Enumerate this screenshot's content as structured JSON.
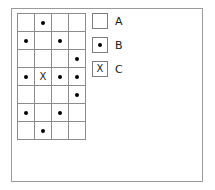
{
  "figure": {
    "type": "symbol-grid-with-legend",
    "frame_color": "#9a9a9a",
    "grid_line_color": "#8c8c8c",
    "marker_color": "#000000"
  },
  "grid": {
    "columns": 4,
    "rows": 7,
    "cells": [
      [
        {
          "symbol": "empty",
          "text": ""
        },
        {
          "symbol": "dot",
          "text": ""
        },
        {
          "symbol": "empty",
          "text": ""
        },
        {
          "symbol": "empty",
          "text": ""
        }
      ],
      [
        {
          "symbol": "dot",
          "text": ""
        },
        {
          "symbol": "empty",
          "text": ""
        },
        {
          "symbol": "dot",
          "text": ""
        },
        {
          "symbol": "empty",
          "text": ""
        }
      ],
      [
        {
          "symbol": "empty",
          "text": ""
        },
        {
          "symbol": "empty",
          "text": ""
        },
        {
          "symbol": "empty",
          "text": ""
        },
        {
          "symbol": "dot",
          "text": ""
        }
      ],
      [
        {
          "symbol": "dot",
          "text": ""
        },
        {
          "symbol": "x",
          "text": "X"
        },
        {
          "symbol": "dot",
          "text": ""
        },
        {
          "symbol": "dot",
          "text": ""
        }
      ],
      [
        {
          "symbol": "empty",
          "text": ""
        },
        {
          "symbol": "empty",
          "text": ""
        },
        {
          "symbol": "empty",
          "text": ""
        },
        {
          "symbol": "dot",
          "text": ""
        }
      ],
      [
        {
          "symbol": "dot",
          "text": ""
        },
        {
          "symbol": "empty",
          "text": ""
        },
        {
          "symbol": "dot",
          "text": ""
        },
        {
          "symbol": "empty",
          "text": ""
        }
      ],
      [
        {
          "symbol": "empty",
          "text": ""
        },
        {
          "symbol": "dot",
          "text": ""
        },
        {
          "symbol": "empty",
          "text": ""
        },
        {
          "symbol": "empty",
          "text": ""
        }
      ]
    ]
  },
  "legend": {
    "items": [
      {
        "symbol": "empty",
        "marker_text": "",
        "label": "A"
      },
      {
        "symbol": "dot",
        "marker_text": "",
        "label": "B"
      },
      {
        "symbol": "x",
        "marker_text": "X",
        "label": "C"
      }
    ]
  }
}
